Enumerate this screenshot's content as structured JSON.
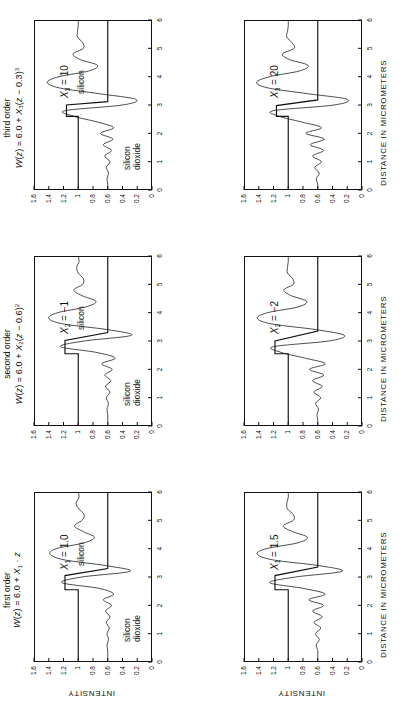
{
  "figure": {
    "orientation": "rotated-90-ccw",
    "rows": 2,
    "columns": 3,
    "axis_x_label": "DISTANCE IN MICROMETERS",
    "axis_y_label": "INTENSITY",
    "x_ticks": [
      "0",
      "1",
      "2",
      "3",
      "4",
      "5",
      "6"
    ],
    "y_ticks": [
      "0",
      "0.2",
      "0.4",
      "0.6",
      "0.8",
      "1",
      "1.2",
      "1.4",
      "1.6"
    ],
    "line_color": "#111111"
  },
  "columns": [
    {
      "id": "first-order",
      "title_line1": "first order",
      "title_line2_html": "W(z) = 6.0 + X<sub>1</sub> &middot; z"
    },
    {
      "id": "second-order",
      "title_line1": "second order",
      "title_line2_html": "W(z) = 6.0 + X<sub>2</sub>(z &minus; 0.6)<sup>2</sup>"
    },
    {
      "id": "third-order",
      "title_line1": "third order",
      "title_line2_html": "W(z) = 6.0 + X<sub>3</sub>(z &minus; 0.3)<sup>3</sup>"
    }
  ],
  "panels": [
    {
      "id": "panel-x1-1p0",
      "column": "first-order",
      "row": "top",
      "param_html": "X<sub>1</sub> = 1.0",
      "material_top": "silicon",
      "material_bottom_line1": "silicon",
      "material_bottom_line2": "dioxide",
      "show_axis_labels": true
    },
    {
      "id": "panel-x2-m1",
      "column": "second-order",
      "row": "top",
      "param_html": "X<sub>2</sub> = &minus;1",
      "material_top": "silicon",
      "material_bottom_line1": "silicon",
      "material_bottom_line2": "dioxide",
      "show_axis_labels": false
    },
    {
      "id": "panel-x3-10",
      "column": "third-order",
      "row": "top",
      "param_html": "X<sub>3</sub> = 10",
      "material_top": "silicon",
      "material_bottom_line1": "silicon",
      "material_bottom_line2": "dioxide",
      "show_axis_labels": false
    },
    {
      "id": "panel-x1-1p5",
      "column": "first-order",
      "row": "bottom",
      "param_html": "X<sub>1</sub> = 1.5",
      "material_top": "",
      "material_bottom_line1": "",
      "material_bottom_line2": "",
      "show_axis_labels": true
    },
    {
      "id": "panel-x2-m2",
      "column": "second-order",
      "row": "bottom",
      "param_html": "X<sub>2</sub> = &minus;2",
      "material_top": "",
      "material_bottom_line1": "",
      "material_bottom_line2": "",
      "show_axis_labels": false
    },
    {
      "id": "panel-x3-20",
      "column": "third-order",
      "row": "bottom",
      "param_html": "X<sub>3</sub> = 20",
      "material_top": "",
      "material_bottom_line1": "",
      "material_bottom_line2": "",
      "show_axis_labels": false
    }
  ],
  "chart_data": {
    "type": "line",
    "xlabel": "DISTANCE IN MICROMETERS",
    "ylabel": "INTENSITY",
    "xlim": [
      0,
      6
    ],
    "ylim": [
      0,
      1.6
    ],
    "xticks": [
      0,
      1,
      2,
      3,
      4,
      5,
      6
    ],
    "yticks": [
      0,
      0.2,
      0.4,
      0.6,
      0.8,
      1.0,
      1.2,
      1.4,
      1.6
    ],
    "grid": false,
    "legend": "none",
    "annotations": [
      "silicon",
      "silicon dioxide"
    ],
    "panels": [
      {
        "name": "X1 = 1.0",
        "series": [
          {
            "name": "ideal step (object)",
            "x": [
              0,
              2.55,
              2.55,
              3.05,
              3.3,
              6
            ],
            "values": [
              1.0,
              1.0,
              1.18,
              1.18,
              0.6,
              0.6
            ]
          },
          {
            "name": "measured intensity",
            "x": [
              0,
              0.2,
              0.4,
              0.6,
              0.8,
              1.0,
              1.2,
              1.4,
              1.6,
              1.8,
              2.0,
              2.2,
              2.4,
              2.6,
              2.8,
              3.0,
              3.2,
              3.4,
              3.6,
              3.8,
              4.0,
              4.2,
              4.4,
              4.6,
              4.8,
              5.0,
              5.2,
              5.4,
              5.6,
              5.8,
              6.0
            ],
            "values": [
              0.6,
              0.6,
              0.6,
              0.61,
              0.59,
              0.61,
              0.58,
              0.62,
              0.57,
              0.63,
              0.55,
              0.66,
              0.52,
              0.72,
              1.22,
              0.95,
              0.3,
              0.62,
              1.18,
              1.38,
              1.3,
              0.93,
              0.78,
              0.93,
              1.05,
              0.95,
              0.92,
              0.99,
              1.03,
              0.99,
              1.0
            ]
          }
        ]
      },
      {
        "name": "X2 = -1",
        "series": [
          {
            "name": "ideal step (object)",
            "x": [
              0,
              2.55,
              2.55,
              3.02,
              3.3,
              6
            ],
            "values": [
              1.0,
              1.0,
              1.18,
              1.18,
              0.6,
              0.6
            ]
          },
          {
            "name": "measured intensity",
            "x": [
              0,
              0.2,
              0.4,
              0.6,
              0.8,
              1.0,
              1.2,
              1.4,
              1.6,
              1.8,
              2.0,
              2.2,
              2.4,
              2.6,
              2.8,
              3.0,
              3.2,
              3.4,
              3.6,
              3.8,
              4.0,
              4.2,
              4.4,
              4.6,
              4.8,
              5.0,
              5.2,
              5.4,
              5.6,
              5.8,
              6.0
            ],
            "values": [
              0.6,
              0.6,
              0.6,
              0.61,
              0.59,
              0.62,
              0.57,
              0.63,
              0.56,
              0.64,
              0.54,
              0.68,
              0.5,
              0.76,
              1.24,
              0.92,
              0.28,
              0.6,
              1.2,
              1.4,
              1.28,
              0.9,
              0.76,
              0.95,
              1.06,
              0.94,
              0.93,
              1.0,
              1.02,
              0.99,
              1.0
            ]
          }
        ]
      },
      {
        "name": "X3 = 10",
        "series": [
          {
            "name": "ideal step (object)",
            "x": [
              0,
              2.6,
              2.6,
              3.0,
              3.12,
              6
            ],
            "values": [
              1.0,
              1.0,
              1.16,
              1.16,
              0.6,
              0.6
            ]
          },
          {
            "name": "measured intensity",
            "x": [
              0,
              0.2,
              0.4,
              0.6,
              0.8,
              1.0,
              1.2,
              1.4,
              1.6,
              1.8,
              2.0,
              2.2,
              2.4,
              2.6,
              2.8,
              3.0,
              3.2,
              3.4,
              3.6,
              3.8,
              4.0,
              4.2,
              4.4,
              4.6,
              4.8,
              5.0,
              5.2,
              5.4,
              5.6,
              5.8,
              6.0
            ],
            "values": [
              0.6,
              0.6,
              0.61,
              0.59,
              0.62,
              0.57,
              0.64,
              0.55,
              0.66,
              0.53,
              0.7,
              0.52,
              0.74,
              1.06,
              1.18,
              0.4,
              0.22,
              0.72,
              1.25,
              1.42,
              1.26,
              0.86,
              0.74,
              0.97,
              1.07,
              0.93,
              0.94,
              1.01,
              1.01,
              1.0,
              1.0
            ]
          }
        ]
      },
      {
        "name": "X1 = 1.5",
        "series": [
          {
            "name": "ideal step (object)",
            "x": [
              0,
              2.55,
              2.55,
              3.05,
              3.35,
              6
            ],
            "values": [
              1.0,
              1.0,
              1.18,
              1.18,
              0.6,
              0.6
            ]
          },
          {
            "name": "measured intensity",
            "x": [
              0,
              0.2,
              0.4,
              0.6,
              0.8,
              1.0,
              1.2,
              1.4,
              1.6,
              1.8,
              2.0,
              2.2,
              2.4,
              2.6,
              2.8,
              3.0,
              3.2,
              3.4,
              3.6,
              3.8,
              4.0,
              4.2,
              4.4,
              4.6,
              4.8,
              5.0,
              5.2,
              5.4,
              5.6,
              5.8,
              6.0
            ],
            "values": [
              0.6,
              0.6,
              0.6,
              0.62,
              0.58,
              0.63,
              0.56,
              0.65,
              0.54,
              0.67,
              0.52,
              0.72,
              0.5,
              0.8,
              1.25,
              0.9,
              0.27,
              0.58,
              1.2,
              1.42,
              1.3,
              0.88,
              0.74,
              0.94,
              1.07,
              0.93,
              0.93,
              1.01,
              1.02,
              1.0,
              1.0
            ]
          }
        ]
      },
      {
        "name": "X2 = -2",
        "series": [
          {
            "name": "ideal step (object)",
            "x": [
              0,
              2.55,
              2.55,
              3.0,
              3.35,
              6
            ],
            "values": [
              1.0,
              1.0,
              1.18,
              1.18,
              0.6,
              0.6
            ]
          },
          {
            "name": "measured intensity",
            "x": [
              0,
              0.2,
              0.4,
              0.6,
              0.8,
              1.0,
              1.2,
              1.4,
              1.6,
              1.8,
              2.0,
              2.2,
              2.4,
              2.6,
              2.8,
              3.0,
              3.2,
              3.4,
              3.6,
              3.8,
              4.0,
              4.2,
              4.4,
              4.6,
              4.8,
              5.0,
              5.2,
              5.4,
              5.6,
              5.8,
              6.0
            ],
            "values": [
              0.6,
              0.6,
              0.61,
              0.59,
              0.63,
              0.56,
              0.65,
              0.54,
              0.67,
              0.52,
              0.71,
              0.5,
              0.78,
              1.1,
              1.2,
              0.45,
              0.24,
              0.62,
              1.22,
              1.42,
              1.28,
              0.87,
              0.75,
              0.96,
              1.06,
              0.93,
              0.94,
              1.01,
              1.01,
              1.0,
              1.0
            ]
          }
        ]
      },
      {
        "name": "X3 = 20",
        "series": [
          {
            "name": "ideal step (object)",
            "x": [
              0,
              2.6,
              2.6,
              2.98,
              3.18,
              6
            ],
            "values": [
              1.0,
              1.0,
              1.16,
              1.16,
              0.6,
              0.6
            ]
          },
          {
            "name": "measured intensity",
            "x": [
              0,
              0.2,
              0.4,
              0.6,
              0.8,
              1.0,
              1.2,
              1.4,
              1.6,
              1.8,
              2.0,
              2.2,
              2.4,
              2.6,
              2.8,
              3.0,
              3.2,
              3.4,
              3.6,
              3.8,
              4.0,
              4.2,
              4.4,
              4.6,
              4.8,
              5.0,
              5.2,
              5.4,
              5.6,
              5.8,
              6.0
            ],
            "values": [
              0.6,
              0.6,
              0.62,
              0.58,
              0.64,
              0.55,
              0.67,
              0.52,
              0.7,
              0.51,
              0.76,
              0.55,
              0.82,
              1.12,
              1.2,
              0.38,
              0.2,
              0.74,
              1.27,
              1.43,
              1.25,
              0.85,
              0.73,
              0.98,
              1.08,
              0.92,
              0.95,
              1.02,
              1.01,
              1.0,
              1.0
            ]
          }
        ]
      }
    ]
  }
}
